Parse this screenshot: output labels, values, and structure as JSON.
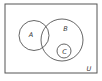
{
  "diagram": {
    "type": "venn",
    "universe": {
      "label": "U",
      "x": 5,
      "y": 4,
      "w": 92,
      "h": 69
    },
    "sets": [
      {
        "label": "A",
        "cx": 34,
        "cy": 35.5,
        "r": 15,
        "label_x": 31,
        "label_y": 36.5
      },
      {
        "label": "B",
        "cx": 62,
        "cy": 40,
        "r": 21,
        "label_x": 65.5,
        "label_y": 30.5
      },
      {
        "label": "C",
        "cx": 64,
        "cy": 51,
        "r": 7,
        "label_x": 64.5,
        "label_y": 53.5
      }
    ],
    "stroke_color": "#555555"
  }
}
